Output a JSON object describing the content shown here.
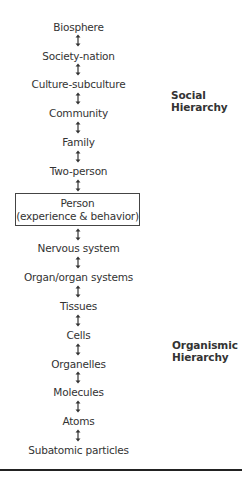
{
  "diagram": {
    "levels": [
      {
        "label": "Biosphere",
        "top": 21
      },
      {
        "label": "Society-nation",
        "top": 50
      },
      {
        "label": "Culture-subculture",
        "top": 78
      },
      {
        "label": "Community",
        "top": 107
      },
      {
        "label": "Family",
        "top": 136
      },
      {
        "label": "Two-person",
        "top": 165
      }
    ],
    "focus": {
      "line1": "Person",
      "line2": "(experience & behavior)"
    },
    "lower_levels": [
      {
        "label": "Nervous system",
        "top": 242
      },
      {
        "label": "Organ/organ systems",
        "top": 271
      },
      {
        "label": "Tissues",
        "top": 300
      },
      {
        "label": "Cells",
        "top": 329
      },
      {
        "label": "Organelles",
        "top": 358
      },
      {
        "label": "Molecules",
        "top": 386
      },
      {
        "label": "Atoms",
        "top": 415
      },
      {
        "label": "Subatomic particles",
        "top": 444
      }
    ],
    "social_label": {
      "line1": "Social",
      "line2": "Hierarchy"
    },
    "organismic_label": {
      "line1": "Organismic",
      "line2": "Hierarchy"
    },
    "arrow_icon": "double-headed-vertical-arrow",
    "colors": {
      "text": "#333333",
      "rule": "#222222",
      "box_border": "#444444"
    }
  }
}
